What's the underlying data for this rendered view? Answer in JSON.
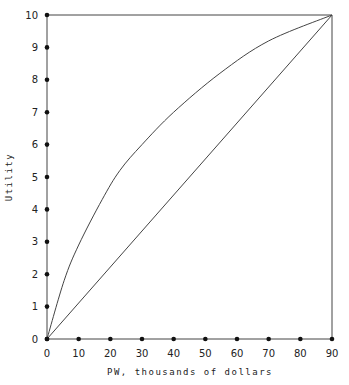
{
  "chart_data": {
    "type": "line",
    "title": "",
    "xlabel": "PW, thousands of dollars",
    "ylabel": "Utility",
    "xlim": [
      0,
      90
    ],
    "ylim": [
      0,
      10
    ],
    "x_ticks": [
      0,
      10,
      20,
      30,
      40,
      50,
      60,
      70,
      80,
      90
    ],
    "y_ticks": [
      0,
      1,
      2,
      3,
      4,
      5,
      6,
      7,
      8,
      9,
      10
    ],
    "grid": false,
    "legend": null,
    "frame": "top and right border lines drawn at y=10 and x=90",
    "series": [
      {
        "name": "Concave utility curve (risk averse)",
        "style": "curve",
        "x": [
          0,
          5.4,
          10,
          17.4,
          23,
          30,
          40,
          54.6,
          70,
          90
        ],
        "y": [
          0,
          1.8,
          2.9,
          4.3,
          5.2,
          6.0,
          7.0,
          8.2,
          9.2,
          10
        ]
      },
      {
        "name": "Linear utility (risk neutral)",
        "style": "straight",
        "x": [
          0,
          90
        ],
        "y": [
          0,
          10
        ]
      }
    ]
  },
  "colors": {
    "line": "#444444",
    "marker": "#111111",
    "background": "#ffffff"
  }
}
